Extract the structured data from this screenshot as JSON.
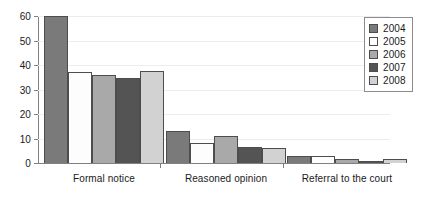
{
  "chart_data": {
    "type": "bar",
    "title": "",
    "subtitle": "",
    "xlabel": "",
    "ylabel": "",
    "categories": [
      "Formal notice",
      "Reasoned opinion",
      "Referral to the court"
    ],
    "series": [
      {
        "name": "2004",
        "color": "#7a7a7a",
        "values": [
          60,
          13,
          3
        ]
      },
      {
        "name": "2005",
        "color": "#fdfdfd",
        "values": [
          37,
          8,
          3
        ]
      },
      {
        "name": "2006",
        "color": "#a9a9a9",
        "values": [
          36,
          11,
          1.5
        ]
      },
      {
        "name": "2007",
        "color": "#545454",
        "values": [
          34.5,
          6.5,
          1
        ]
      },
      {
        "name": "2008",
        "color": "#d2d2d2",
        "values": [
          37.5,
          6,
          1.5
        ]
      }
    ],
    "ylim": [
      0,
      60
    ],
    "yticks": [
      0,
      10,
      20,
      30,
      40,
      50,
      60
    ],
    "ytick_labels": [
      "0",
      "10",
      "20",
      "30",
      "40",
      "50",
      "60"
    ],
    "grid": true,
    "grid_axis": "y",
    "legend_position": "top-right",
    "bar_edge_color": "#4d4d4d",
    "axis_color": "#808080",
    "background": "#ffffff"
  }
}
